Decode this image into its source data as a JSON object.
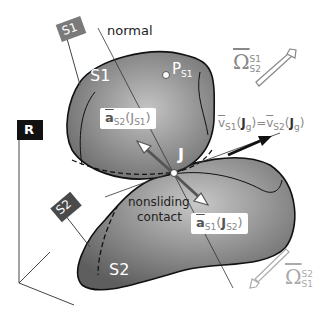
{
  "figure": {
    "frame_label": "R",
    "body1": {
      "name": "S1",
      "flag_label": "S1",
      "point_label": "P",
      "point_sub": "S1"
    },
    "body2": {
      "name": "S2",
      "flag_label": "S2"
    },
    "normal_label": "normal",
    "contact_point": "J",
    "contact_label_line1": "nonsliding",
    "contact_label_line2": "contact",
    "accel_s2": {
      "symbol": "a",
      "sub": "S2",
      "arg": "J",
      "arg_sub": "S1"
    },
    "accel_s1": {
      "symbol": "a",
      "sub": "S1",
      "arg": "J",
      "arg_sub": "S2"
    },
    "velocity": {
      "lhs_sym": "v",
      "lhs_sub": "S1",
      "lhs_arg": "J",
      "lhs_arg_sub": "g",
      "eq": "=",
      "rhs_sym": "v",
      "rhs_sub": "S2",
      "rhs_arg": "J",
      "rhs_arg_sub": "g"
    },
    "omega_top": {
      "symbol": "Ω",
      "sup": "S1",
      "sub": "S2"
    },
    "omega_bottom": {
      "symbol": "Ω",
      "sup": "S2",
      "sub": "S1"
    },
    "colors": {
      "body_dark": "#6e6e6e",
      "body_light": "#bdbdbd",
      "flag_s1": "#7a7a7a",
      "flag_s2": "#4a4a4a",
      "flag_r": "#111111",
      "arrow_grey": "#999999"
    }
  }
}
